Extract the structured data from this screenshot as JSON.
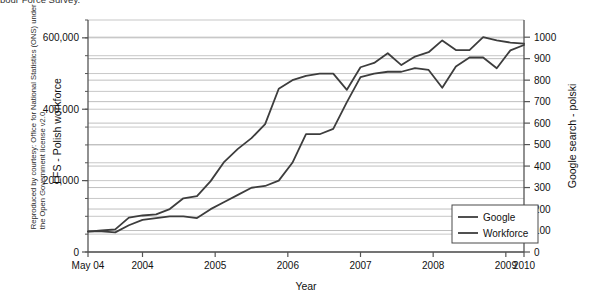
{
  "caption": {
    "top_cut_text": "bour Force Survey.",
    "attribution_line1": "Reproduced by courtesy: Office for National Statistics (ONS) under",
    "attribution_line2": "the Open Government license v2.0"
  },
  "chart_data": {
    "type": "line",
    "title": "",
    "xlabel": "Year",
    "ylabel": "LFS - Polish workforce",
    "ylabel_right": "Google search - polski",
    "grid": true,
    "legend_position": "bottom-right",
    "xlim": [
      0,
      24
    ],
    "x_tick_positions": [
      0,
      3,
      7,
      11,
      15,
      19,
      23,
      24
    ],
    "x_tick_labels": [
      "May 04",
      "2004",
      "2005",
      "2006",
      "2007",
      "2008",
      "2009",
      "2010"
    ],
    "left_axis": {
      "label": "LFS - Polish workforce",
      "ylim": [
        0,
        650000
      ],
      "major_ticks": [
        0,
        200000,
        400000,
        600000
      ],
      "major_tick_labels": [
        "0",
        "200,000",
        "400,000",
        "600,000"
      ],
      "minor_tick_step": 50000
    },
    "right_axis": {
      "label": "Google search - polski",
      "ylim": [
        0,
        1080
      ],
      "ticks": [
        0,
        100,
        200,
        300,
        400,
        500,
        600,
        700,
        800,
        900,
        1000
      ],
      "tick_labels": [
        "0",
        "100",
        "200",
        "300",
        "400",
        "500",
        "600",
        "700",
        "800",
        "900",
        "1000"
      ]
    },
    "series": [
      {
        "name": "Google",
        "axis": "right",
        "color": "#3d3d3d",
        "values": [
          95,
          100,
          105,
          160,
          170,
          175,
          200,
          250,
          260,
          330,
          420,
          480,
          530,
          595,
          760,
          800,
          820,
          830,
          830,
          755,
          860,
          880,
          925,
          870,
          910,
          930,
          985,
          940,
          940,
          1000,
          985,
          975,
          970
        ]
      },
      {
        "name": "Workforce",
        "axis": "left",
        "color": "#3d3d3d",
        "values": [
          58000,
          58000,
          55000,
          75000,
          90000,
          95000,
          100000,
          100000,
          95000,
          120000,
          140000,
          160000,
          180000,
          185000,
          200000,
          250000,
          330000,
          330000,
          345000,
          420000,
          490000,
          500000,
          505000,
          505000,
          515000,
          510000,
          460000,
          520000,
          545000,
          545000,
          515000,
          565000,
          580000
        ]
      }
    ],
    "legend": [
      {
        "label": "Google",
        "color": "#3d3d3d"
      },
      {
        "label": "Workforce",
        "color": "#3d3d3d"
      }
    ]
  },
  "colors": {
    "line": "#3d3d3d",
    "grid": "#bfbfbf",
    "axis": "#555555",
    "text": "#111111",
    "background": "#ffffff"
  }
}
